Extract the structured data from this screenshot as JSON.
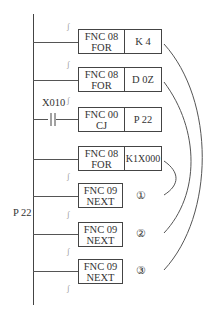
{
  "diagram": {
    "type": "ladder-diagram",
    "left_label": "P 22",
    "contact_label": "X010",
    "rungs": [
      {
        "fnc": "FNC 08",
        "name": "FOR",
        "operand": "K 4"
      },
      {
        "fnc": "FNC 08",
        "name": "FOR",
        "operand": "D 0Z"
      },
      {
        "fnc": "FNC 00",
        "name": "CJ",
        "operand": "P 22"
      },
      {
        "fnc": "FNC 08",
        "name": "FOR",
        "operand": "K1X000"
      },
      {
        "fnc": "FNC 09",
        "name": "NEXT",
        "marker": "①"
      },
      {
        "fnc": "FNC 09",
        "name": "NEXT",
        "marker": "②"
      },
      {
        "fnc": "FNC 09",
        "name": "NEXT",
        "marker": "③"
      }
    ],
    "break_mark": "∫"
  }
}
